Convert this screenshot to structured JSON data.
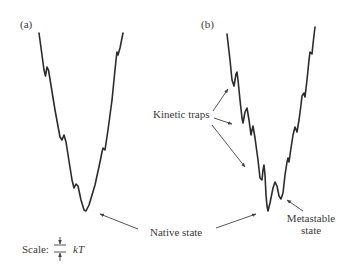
{
  "panels": [
    {
      "id": "a",
      "label": "(a)"
    },
    {
      "id": "b",
      "label": "(b)"
    }
  ],
  "annotations": {
    "kinetic_traps": "Kinetic traps",
    "native_state": "Native state",
    "metastable_line1": "Metastable",
    "metastable_line2": "state"
  },
  "scale": {
    "label": "Scale:",
    "unit": "kT"
  },
  "colors": {
    "curve": "#2b2b2b",
    "arrow": "#444444",
    "text": "#3a3a3a"
  }
}
